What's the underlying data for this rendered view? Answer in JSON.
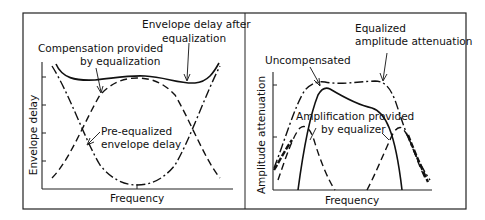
{
  "left_panel": {
    "x_axis_label": "Frequency",
    "y_axis_label": "Envelope delay",
    "annotations": {
      "after_line1": "Envelope delay after",
      "after_line2": "equalization",
      "comp_line1": "Compensation provided",
      "comp_line2": "by equalization",
      "pre_line1": "Pre-equalized",
      "pre_line2": "envelope delay"
    },
    "curves": [
      {
        "name": "Envelope delay after equalization",
        "style": "solid"
      },
      {
        "name": "Compensation provided by equalization",
        "style": "dashed"
      },
      {
        "name": "Pre-equalized envelope delay",
        "style": "dash-dot"
      }
    ]
  },
  "right_panel": {
    "x_axis_label": "Frequency",
    "y_axis_label": "Amplitude attenuation",
    "annotations": {
      "eq_line1": "Equalized",
      "eq_line2": "amplitude attenuation",
      "uncomp": "Uncompensated",
      "amp_line1": "Amplification provided",
      "amp_line2": "by equalizer"
    },
    "curves": [
      {
        "name": "Equalized amplitude attenuation",
        "style": "dash-dot"
      },
      {
        "name": "Uncompensated",
        "style": "solid"
      },
      {
        "name": "Amplification provided by equalizer",
        "style": "dashed"
      }
    ]
  },
  "colors": {
    "ink": "#111111",
    "background": "#ffffff"
  }
}
